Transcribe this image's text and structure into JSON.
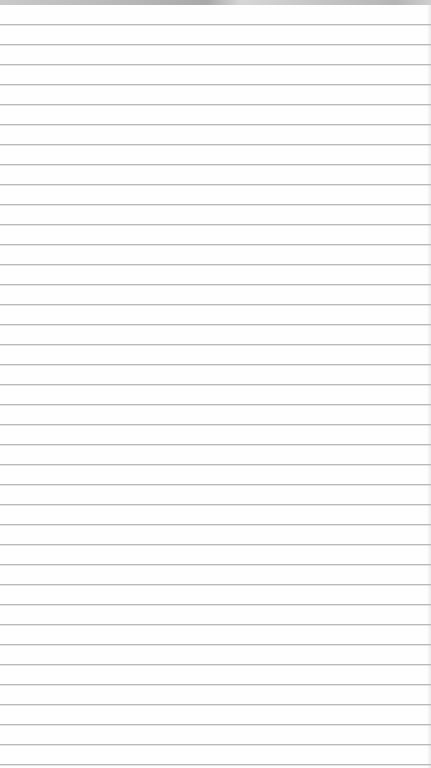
{
  "page": {
    "type": "ruled-notepad",
    "background_color": "#fefefe",
    "line_color": "#b9b9b9",
    "top_edge_color": "#b7b7b7",
    "line_spacing_px": 20,
    "first_line_y_px": 24,
    "line_count": 38,
    "text_lines": []
  }
}
